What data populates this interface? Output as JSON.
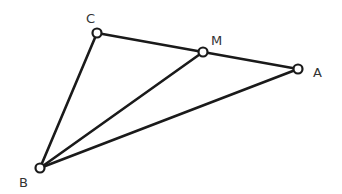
{
  "diagram": {
    "type": "geometry",
    "points": [
      {
        "id": "C",
        "label": "C",
        "x": 97,
        "y": 33,
        "label_x": 86,
        "label_y": 23
      },
      {
        "id": "M",
        "label": "M",
        "x": 203,
        "y": 52,
        "label_x": 211,
        "label_y": 45
      },
      {
        "id": "A",
        "label": "A",
        "x": 298,
        "y": 69,
        "label_x": 313,
        "label_y": 77
      },
      {
        "id": "B",
        "label": "B",
        "x": 40,
        "y": 168,
        "label_x": 19,
        "label_y": 187
      }
    ],
    "segments": [
      {
        "from": "C",
        "to": "M"
      },
      {
        "from": "M",
        "to": "A"
      },
      {
        "from": "C",
        "to": "B"
      },
      {
        "from": "B",
        "to": "M"
      },
      {
        "from": "B",
        "to": "A"
      }
    ],
    "colors": {
      "stroke": "#1a1a1a",
      "label": "#333333",
      "background": "#ffffff"
    }
  }
}
